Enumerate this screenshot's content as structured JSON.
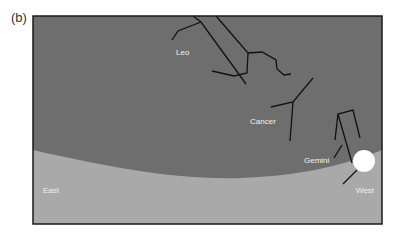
{
  "panel_label": "(b)",
  "colors": {
    "sky": "#6e6e6e",
    "ground": "#a9a9a9",
    "frame": "#1a1a1a",
    "lines": "#111111",
    "sun": "#ffffff",
    "label": "#f2f2f2"
  },
  "constellations": [
    {
      "name": "Leo",
      "label": "Leo"
    },
    {
      "name": "Cancer",
      "label": "Cancer"
    },
    {
      "name": "Gemini",
      "label": "Gemini"
    }
  ],
  "directions": {
    "east": "East",
    "west": "West"
  },
  "sun": {
    "description": "Sun setting on western horizon"
  }
}
